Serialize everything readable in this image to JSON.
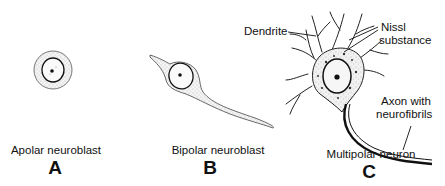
{
  "panels": [
    {
      "id": "A",
      "letter": "A",
      "caption": "Apolar neuroblast"
    },
    {
      "id": "B",
      "letter": "B",
      "caption": "Bipolar neuroblast"
    },
    {
      "id": "C",
      "letter": "C",
      "caption": "Multipolar neuron"
    }
  ],
  "labels": {
    "dendrite": "Dendrite",
    "nissl_line1": "Nissl",
    "nissl_line2": "substance",
    "axon_line1": "Axon with",
    "axon_line2": "neurofibrils"
  },
  "colors": {
    "ink": "#111111",
    "stipple": "#bdbdbd",
    "background": "#ffffff"
  }
}
